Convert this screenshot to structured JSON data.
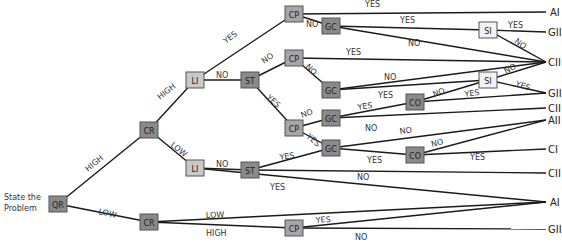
{
  "start_label": [
    "State the",
    "Problem"
  ],
  "colors": {
    "node_dark": "#8a8a8a",
    "node_mid": "#a6a6a6",
    "node_light": "#c9c9c9",
    "node_white": "#f2f2f2",
    "edge": "#1a1a1a"
  },
  "nodes": [
    {
      "id": "QR",
      "label": "QR",
      "x": 58,
      "y": 204,
      "shade": "dark"
    },
    {
      "id": "CR1",
      "label": "CR",
      "x": 149,
      "y": 130,
      "shade": "dark"
    },
    {
      "id": "CR2",
      "label": "CR",
      "x": 149,
      "y": 222,
      "shade": "dark"
    },
    {
      "id": "LI1",
      "label": "LI",
      "x": 195,
      "y": 80,
      "shade": "light"
    },
    {
      "id": "LI2",
      "label": "LI",
      "x": 195,
      "y": 168,
      "shade": "light"
    },
    {
      "id": "ST1",
      "label": "ST",
      "x": 250,
      "y": 80,
      "shade": "dark"
    },
    {
      "id": "ST2",
      "label": "ST",
      "x": 250,
      "y": 170,
      "shade": "dark"
    },
    {
      "id": "CP1",
      "label": "CP",
      "x": 294,
      "y": 14,
      "shade": "mid"
    },
    {
      "id": "CP2",
      "label": "CP",
      "x": 294,
      "y": 58,
      "shade": "mid"
    },
    {
      "id": "CP3",
      "label": "CP",
      "x": 294,
      "y": 128,
      "shade": "mid"
    },
    {
      "id": "CP4",
      "label": "CP",
      "x": 294,
      "y": 228,
      "shade": "mid"
    },
    {
      "id": "GC1",
      "label": "GC",
      "x": 331,
      "y": 26,
      "shade": "dark"
    },
    {
      "id": "GC2",
      "label": "GC",
      "x": 331,
      "y": 90,
      "shade": "dark"
    },
    {
      "id": "GC3",
      "label": "GC",
      "x": 331,
      "y": 118,
      "shade": "dark"
    },
    {
      "id": "GC4",
      "label": "GC",
      "x": 331,
      "y": 148,
      "shade": "dark"
    },
    {
      "id": "CO1",
      "label": "CO",
      "x": 415,
      "y": 102,
      "shade": "dark"
    },
    {
      "id": "CO2",
      "label": "CO",
      "x": 415,
      "y": 155,
      "shade": "dark"
    },
    {
      "id": "SI1",
      "label": "SI",
      "x": 488,
      "y": 30,
      "shade": "white"
    },
    {
      "id": "SI2",
      "label": "SI",
      "x": 488,
      "y": 80,
      "shade": "white"
    }
  ],
  "outcomes": [
    {
      "label": "AI",
      "x": 550,
      "y": 12
    },
    {
      "label": "GII",
      "x": 548,
      "y": 32
    },
    {
      "label": "CII",
      "x": 548,
      "y": 62
    },
    {
      "label": "GII",
      "x": 548,
      "y": 93
    },
    {
      "label": "CII",
      "x": 548,
      "y": 108
    },
    {
      "label": "AII",
      "x": 548,
      "y": 120
    },
    {
      "label": "CI",
      "x": 548,
      "y": 149
    },
    {
      "label": "CII",
      "x": 548,
      "y": 173
    },
    {
      "label": "AI",
      "x": 550,
      "y": 202
    },
    {
      "label": "GII",
      "x": 548,
      "y": 229
    }
  ],
  "edges": [
    {
      "from": [
        58,
        204
      ],
      "to": [
        149,
        130
      ]
    },
    {
      "from": [
        58,
        204
      ],
      "to": [
        149,
        222
      ]
    },
    {
      "from": [
        149,
        130
      ],
      "to": [
        195,
        80
      ]
    },
    {
      "from": [
        149,
        130
      ],
      "to": [
        195,
        168
      ]
    },
    {
      "from": [
        195,
        80
      ],
      "to": [
        294,
        14
      ]
    },
    {
      "from": [
        195,
        80
      ],
      "to": [
        250,
        80
      ]
    },
    {
      "from": [
        250,
        80
      ],
      "to": [
        294,
        58
      ]
    },
    {
      "from": [
        250,
        80
      ],
      "to": [
        294,
        128
      ]
    },
    {
      "from": [
        294,
        14
      ],
      "to": [
        546,
        12
      ]
    },
    {
      "from": [
        294,
        14
      ],
      "to": [
        331,
        26
      ]
    },
    {
      "from": [
        331,
        26
      ],
      "to": [
        488,
        30
      ]
    },
    {
      "from": [
        331,
        26
      ],
      "to": [
        546,
        62
      ]
    },
    {
      "from": [
        488,
        30
      ],
      "to": [
        546,
        32
      ]
    },
    {
      "from": [
        488,
        30
      ],
      "to": [
        546,
        62
      ]
    },
    {
      "from": [
        294,
        58
      ],
      "to": [
        546,
        62
      ]
    },
    {
      "from": [
        294,
        58
      ],
      "to": [
        331,
        90
      ]
    },
    {
      "from": [
        331,
        90
      ],
      "to": [
        546,
        62
      ]
    },
    {
      "from": [
        331,
        90
      ],
      "to": [
        488,
        80
      ]
    },
    {
      "from": [
        488,
        80
      ],
      "to": [
        546,
        62
      ]
    },
    {
      "from": [
        488,
        80
      ],
      "to": [
        546,
        93
      ]
    },
    {
      "from": [
        294,
        128
      ],
      "to": [
        331,
        118
      ]
    },
    {
      "from": [
        294,
        128
      ],
      "to": [
        331,
        148
      ]
    },
    {
      "from": [
        331,
        118
      ],
      "to": [
        415,
        102
      ]
    },
    {
      "from": [
        331,
        118
      ],
      "to": [
        546,
        108
      ]
    },
    {
      "from": [
        415,
        102
      ],
      "to": [
        488,
        80
      ]
    },
    {
      "from": [
        415,
        102
      ],
      "to": [
        546,
        93
      ]
    },
    {
      "from": [
        331,
        148
      ],
      "to": [
        546,
        120
      ]
    },
    {
      "from": [
        331,
        148
      ],
      "to": [
        415,
        155
      ]
    },
    {
      "from": [
        415,
        155
      ],
      "to": [
        546,
        120
      ]
    },
    {
      "from": [
        415,
        155
      ],
      "to": [
        546,
        149
      ]
    },
    {
      "from": [
        195,
        168
      ],
      "to": [
        250,
        170
      ]
    },
    {
      "from": [
        195,
        168
      ],
      "to": [
        546,
        202
      ]
    },
    {
      "from": [
        250,
        170
      ],
      "to": [
        331,
        148
      ]
    },
    {
      "from": [
        250,
        170
      ],
      "to": [
        546,
        173
      ]
    },
    {
      "from": [
        149,
        222
      ],
      "to": [
        546,
        202
      ]
    },
    {
      "from": [
        149,
        222
      ],
      "to": [
        294,
        228
      ]
    },
    {
      "from": [
        294,
        228
      ],
      "to": [
        546,
        202
      ]
    },
    {
      "from": [
        294,
        228
      ],
      "to": [
        546,
        229
      ]
    }
  ],
  "edge_labels": [
    {
      "text": "HIGH",
      "x": 88,
      "y": 172,
      "rot": -40
    },
    {
      "text": "LOW",
      "x": 98,
      "y": 214,
      "rot": 12
    },
    {
      "text": "HIGH",
      "x": 160,
      "y": 100,
      "rot": -38
    },
    {
      "text": "LOW",
      "x": 170,
      "y": 146,
      "rot": 38
    },
    {
      "text": "YES",
      "x": 226,
      "y": 44,
      "rot": -38
    },
    {
      "text": "NO",
      "x": 216,
      "y": 78,
      "rot": 0
    },
    {
      "text": "NO",
      "x": 264,
      "y": 64,
      "rot": -35
    },
    {
      "text": "YES",
      "x": 266,
      "y": 98,
      "rot": 42
    },
    {
      "text": "YES",
      "x": 365,
      "y": 7,
      "rot": 0
    },
    {
      "text": "NO",
      "x": 306,
      "y": 27,
      "rot": 0
    },
    {
      "text": "YES",
      "x": 400,
      "y": 23,
      "rot": 0
    },
    {
      "text": "NO",
      "x": 408,
      "y": 46,
      "rot": 0
    },
    {
      "text": "YES",
      "x": 508,
      "y": 28,
      "rot": 0
    },
    {
      "text": "NO",
      "x": 514,
      "y": 42,
      "rot": 38
    },
    {
      "text": "YES",
      "x": 346,
      "y": 55,
      "rot": 0
    },
    {
      "text": "NO",
      "x": 305,
      "y": 67,
      "rot": 45
    },
    {
      "text": "NO",
      "x": 384,
      "y": 80,
      "rot": 0
    },
    {
      "text": "YES",
      "x": 378,
      "y": 98,
      "rot": 0
    },
    {
      "text": "NO",
      "x": 506,
      "y": 74,
      "rot": -30
    },
    {
      "text": "YES",
      "x": 515,
      "y": 86,
      "rot": 18
    },
    {
      "text": "YES",
      "x": 358,
      "y": 110,
      "rot": -8
    },
    {
      "text": "NO",
      "x": 365,
      "y": 131,
      "rot": 0
    },
    {
      "text": "NO",
      "x": 434,
      "y": 97,
      "rot": -20
    },
    {
      "text": "YES",
      "x": 465,
      "y": 97,
      "rot": -8
    },
    {
      "text": "NO",
      "x": 302,
      "y": 118,
      "rot": -20
    },
    {
      "text": "YES",
      "x": 306,
      "y": 137,
      "rot": 42
    },
    {
      "text": "NO",
      "x": 400,
      "y": 134,
      "rot": -8
    },
    {
      "text": "NO",
      "x": 432,
      "y": 147,
      "rot": -15
    },
    {
      "text": "YES",
      "x": 367,
      "y": 163,
      "rot": 0
    },
    {
      "text": "YES",
      "x": 470,
      "y": 160,
      "rot": 0
    },
    {
      "text": "NO",
      "x": 216,
      "y": 167,
      "rot": 0
    },
    {
      "text": "YES",
      "x": 280,
      "y": 160,
      "rot": -8
    },
    {
      "text": "NO",
      "x": 357,
      "y": 180,
      "rot": 0
    },
    {
      "text": "YES",
      "x": 270,
      "y": 190,
      "rot": 0
    },
    {
      "text": "LOW",
      "x": 206,
      "y": 218,
      "rot": -3
    },
    {
      "text": "HIGH",
      "x": 206,
      "y": 236,
      "rot": 0
    },
    {
      "text": "YES",
      "x": 316,
      "y": 223,
      "rot": -5
    },
    {
      "text": "NO",
      "x": 355,
      "y": 240,
      "rot": 0
    }
  ]
}
